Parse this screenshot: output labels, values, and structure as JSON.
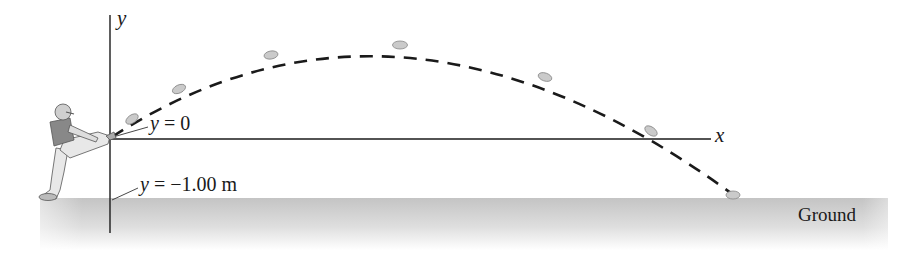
{
  "diagram": {
    "axes": {
      "y_label": "y",
      "x_label": "x"
    },
    "annotations": {
      "y_zero": "y = 0",
      "y_zero_var": "y",
      "y_zero_eq": "= 0",
      "y_ground_var": "y",
      "y_ground_eq": "= −1.00 m"
    },
    "ground_label": "Ground",
    "colors": {
      "ground": "#c8c8c8",
      "ball": "#c9c9c9",
      "line": "#1a1a1a"
    }
  }
}
